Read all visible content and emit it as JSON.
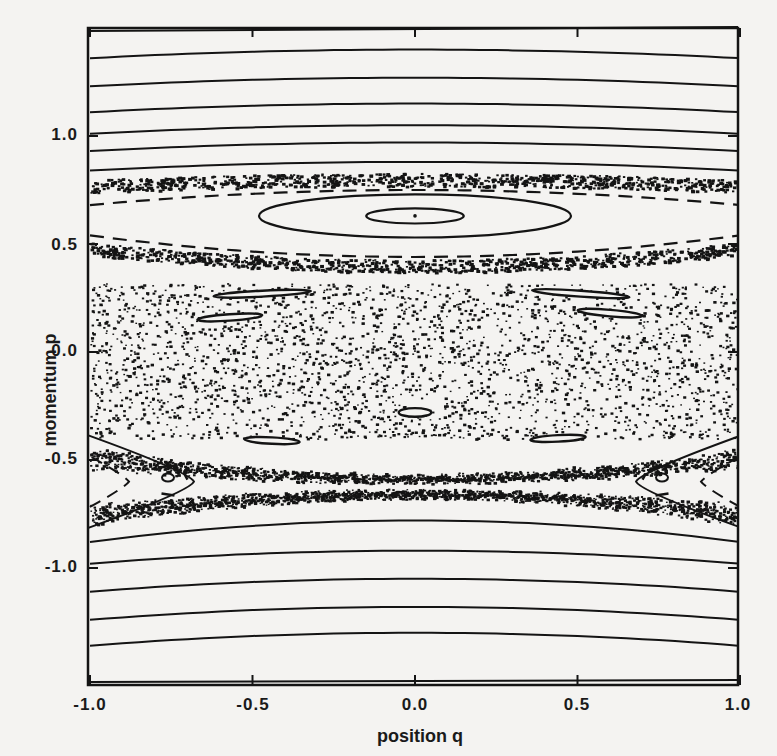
{
  "chart_data": {
    "type": "scatter",
    "title": "",
    "subtitle": "Poincaré surface of section (phase-space portrait)",
    "xlabel": "position q",
    "ylabel": "momentum p",
    "xlim": [
      -1.0,
      1.0
    ],
    "ylim": [
      -1.35,
      1.7
    ],
    "grid": false,
    "legend": null,
    "x_ticks": [
      -1.0,
      -0.5,
      0.0,
      0.5,
      1.0
    ],
    "x_tick_labels": [
      "-1.0",
      "-0.5",
      "0.0",
      "0.5",
      "1.0"
    ],
    "y_ticks": [
      1.0,
      0.5,
      0.0,
      -0.5,
      -1.0
    ],
    "y_tick_labels": [
      "1.0",
      "0.5",
      "0.0",
      "-0.5",
      "-1.0"
    ],
    "regions": {
      "upper_rotational_curves": {
        "description": "nearly horizontal invariant curves (KAM tori) above the upper chaotic separatrix layer",
        "p_levels_center": [
          1.55,
          1.4,
          1.27,
          1.15,
          1.05,
          0.97,
          0.88
        ],
        "edge_drop": 0.04
      },
      "upper_separatrix_layer": {
        "description": "thin chaotic band + dashed curves",
        "p_center_mid": 0.8,
        "p_center_edge": 0.78
      },
      "central_resonance_island": {
        "center": [
          0.0,
          0.63
        ],
        "ellipses": [
          {
            "half_width_q": 0.48,
            "half_height_p": 0.1
          },
          {
            "half_width_q": 0.15,
            "half_height_p": 0.035
          }
        ],
        "fixed_point": [
          0.0,
          0.63
        ]
      },
      "lower_separatrix_layer": {
        "description": "thin chaotic band + dashed curves around p≈0.5",
        "p_center_mid": 0.42,
        "p_center_edge": 0.5
      },
      "chaotic_sea": {
        "description": "widespread scattered points",
        "q_range": [
          -1.0,
          1.0
        ],
        "p_range": [
          -0.4,
          0.32
        ]
      },
      "small_island_chain": [
        {
          "q": -0.47,
          "p": 0.27,
          "w": 0.3,
          "h": 0.02,
          "tilt_deg": -3
        },
        {
          "q": -0.57,
          "p": 0.16,
          "w": 0.2,
          "h": 0.03,
          "tilt_deg": -4
        },
        {
          "q": 0.51,
          "p": 0.27,
          "w": 0.3,
          "h": 0.02,
          "tilt_deg": 4
        },
        {
          "q": 0.6,
          "p": 0.18,
          "w": 0.2,
          "h": 0.03,
          "tilt_deg": 5
        },
        {
          "q": 0.0,
          "p": -0.28,
          "w": 0.1,
          "h": 0.04,
          "tilt_deg": 0
        },
        {
          "q": -0.44,
          "p": -0.41,
          "w": 0.17,
          "h": 0.03,
          "tilt_deg": 3
        },
        {
          "q": 0.44,
          "p": -0.4,
          "w": 0.17,
          "h": 0.03,
          "tilt_deg": -3
        }
      ],
      "x_point_lobes": {
        "description": "hyperbolic crossings of separatrix near q=±1, p≈-0.6, with interior islands",
        "centers": [
          [
            -1.0,
            -0.6
          ],
          [
            1.0,
            -0.6
          ]
        ],
        "chaotic_band_p_range": [
          -0.78,
          -0.48
        ]
      },
      "lower_rotational_curves": {
        "description": "nearly horizontal invariant curves below lower chaotic band",
        "p_levels_center": [
          -0.78,
          -0.92,
          -1.05,
          -1.18,
          -1.3
        ],
        "edge_drop": 0.06
      }
    }
  },
  "axes": {
    "x_label": "position q",
    "y_label": "momentum p",
    "x_ticks": [
      "-1.0",
      "-0.5",
      "0.0",
      "0.5",
      "1.0"
    ],
    "y_ticks": [
      "1.0",
      "0.5",
      "0.0",
      "-0.5",
      "-1.0"
    ]
  },
  "colors": {
    "background": "#f4f3f1",
    "ink": "#141414"
  }
}
